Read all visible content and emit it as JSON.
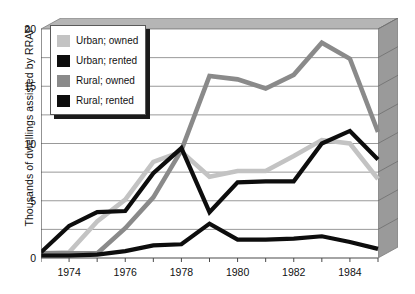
{
  "chart_data": {
    "type": "line",
    "title": "",
    "xlabel": "",
    "ylabel": "Thousands of dwellings assisted by RRAP",
    "ylim": [
      0,
      20
    ],
    "yticks": [
      0,
      5,
      10,
      15,
      20
    ],
    "gridlines": [
      0,
      2.5,
      5,
      7.5,
      10,
      12.5,
      15,
      17.5,
      20
    ],
    "grid": true,
    "legend_position": "top-left",
    "x": [
      1973,
      1974,
      1975,
      1976,
      1977,
      1978,
      1979,
      1980,
      1981,
      1982,
      1983,
      1984,
      1985
    ],
    "xticks": [
      1973,
      1974,
      1975,
      1976,
      1977,
      1978,
      1979,
      1980,
      1981,
      1982,
      1983,
      1984,
      1985
    ],
    "xtick_labels": [
      "1974",
      "1976",
      "1978",
      "1980",
      "1982",
      "1984"
    ],
    "xtick_label_values": [
      1974,
      1976,
      1978,
      1980,
      1982,
      1984
    ],
    "series": [
      {
        "name": "Urban; owned",
        "color": "#c3c3c3",
        "values": [
          0.4,
          0.5,
          3.2,
          5.1,
          8.4,
          9.3,
          7.1,
          7.6,
          7.6,
          8.9,
          10.3,
          10.0,
          6.9
        ]
      },
      {
        "name": "Urban; rented",
        "color": "#0d0d0d",
        "values": [
          0.5,
          2.8,
          4.0,
          4.1,
          7.4,
          9.6,
          4.0,
          6.6,
          6.7,
          6.7,
          10.0,
          11.1,
          8.6
        ]
      },
      {
        "name": "Rural; owned",
        "color": "#8a8a8a",
        "values": [
          0.4,
          0.4,
          0.4,
          2.6,
          5.3,
          9.4,
          15.9,
          15.6,
          14.8,
          16.0,
          18.8,
          17.4,
          11.0
        ]
      },
      {
        "name": "Rural; rented",
        "color": "#0d0d0d",
        "values": [
          0.2,
          0.2,
          0.3,
          0.6,
          1.1,
          1.2,
          3.0,
          1.6,
          1.6,
          1.7,
          1.9,
          1.4,
          0.8
        ]
      }
    ]
  },
  "legend": {
    "items": [
      {
        "label": "Urban; owned",
        "color": "#c3c3c3"
      },
      {
        "label": "Urban; rented",
        "color": "#0d0d0d"
      },
      {
        "label": "Rural; owned",
        "color": "#8a8a8a"
      },
      {
        "label": "Rural; rented",
        "color": "#0d0d0d"
      }
    ]
  },
  "style": {
    "wall_color": "#9a9a9a",
    "wall_top_color": "#b5b5b5",
    "plot_bg": "#ffffff",
    "grid_color": "#8d8d8d",
    "axis_color": "#4a4a4a"
  }
}
